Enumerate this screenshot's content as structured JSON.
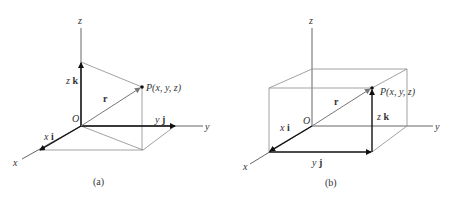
{
  "figure": {
    "panels": [
      {
        "id": "a",
        "caption": "(a)",
        "axis_labels": {
          "x": "x",
          "y": "y",
          "z": "z"
        },
        "origin_label": "O",
        "point_label": "P(x, y, z)",
        "position_vector_label": "r",
        "component_labels": {
          "x_coef": "x",
          "x_unit": "i",
          "y_coef": "y",
          "y_unit": "j",
          "z_coef": "z",
          "z_unit": "k"
        }
      },
      {
        "id": "b",
        "caption": "(b)",
        "axis_labels": {
          "x": "x",
          "y": "y",
          "z": "z"
        },
        "origin_label": "O",
        "point_label": "P(x, y, z)",
        "position_vector_label": "r",
        "component_labels": {
          "x_coef": "x",
          "x_unit": "i",
          "y_coef": "y",
          "y_unit": "j",
          "z_coef": "z",
          "z_unit": "k"
        }
      }
    ],
    "colors": {
      "background": "#ffffff",
      "vector": "#111111",
      "construction_line": "#8a8a8a",
      "axis": "#555555",
      "text": "#333333"
    }
  }
}
